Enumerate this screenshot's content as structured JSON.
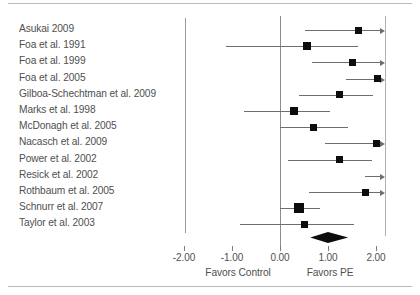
{
  "chart_data": {
    "type": "forest",
    "title": "",
    "xlabel": "",
    "ylabel": "",
    "xlim": [
      -2.0,
      2.2
    ],
    "xticks": [
      -2.0,
      -1.0,
      0.0,
      1.0,
      2.0
    ],
    "xtick_labels": [
      "-2.00",
      "-1.00",
      "0.00",
      "1.00",
      "2.00"
    ],
    "grid": false,
    "null_line": 0.0,
    "left_axis_label": "Favors Control",
    "right_axis_label": "Favors PE",
    "effect_measure": "Hedges' g",
    "categories": [
      "Asukai 2009",
      "Foa et al. 1991",
      "Foa et al. 1999",
      "Foa et al. 2005",
      "Gilboa-Schechtman et al. 2009",
      "Marks et al. 1998",
      "McDonagh et al. 2005",
      "Nacasch et al. 2009",
      "Power et al. 2002",
      "Resick et al. 2002",
      "Rothbaum et al. 2005",
      "Schnurr et al. 2007",
      "Taylor et al. 2003"
    ],
    "studies": [
      {
        "label": "Asukai 2009",
        "effect": 1.63,
        "ci_low": 0.52,
        "ci_high": 2.2,
        "marker_size": 7,
        "clipped_high": true,
        "clipped_low": false
      },
      {
        "label": "Foa et al. 1991",
        "effect": 0.56,
        "ci_low": -1.13,
        "ci_high": 1.62,
        "marker_size": 8,
        "clipped_high": false,
        "clipped_low": false
      },
      {
        "label": "Foa et al. 1999",
        "effect": 1.52,
        "ci_low": 0.67,
        "ci_high": 2.2,
        "marker_size": 7,
        "clipped_high": true,
        "clipped_low": false
      },
      {
        "label": "Foa et al. 2005",
        "effect": 2.04,
        "ci_low": 1.38,
        "ci_high": 2.2,
        "marker_size": 7,
        "clipped_high": true,
        "clipped_low": false
      },
      {
        "label": "Gilboa-Schechtman et al. 2009",
        "effect": 1.23,
        "ci_low": 0.4,
        "ci_high": 1.94,
        "marker_size": 7,
        "clipped_high": false,
        "clipped_low": false
      },
      {
        "label": "Marks et al. 1998",
        "effect": 0.29,
        "ci_low": -0.75,
        "ci_high": 1.04,
        "marker_size": 8,
        "clipped_high": false,
        "clipped_low": false
      },
      {
        "label": "McDonagh et al. 2005",
        "effect": 0.69,
        "ci_low": 0.0,
        "ci_high": 1.42,
        "marker_size": 7,
        "clipped_high": false,
        "clipped_low": false
      },
      {
        "label": "Nacasch et al. 2009",
        "effect": 2.02,
        "ci_low": 0.94,
        "ci_high": 2.2,
        "marker_size": 7,
        "clipped_high": true,
        "clipped_low": false
      },
      {
        "label": "Power et al. 2002",
        "effect": 1.23,
        "ci_low": 0.17,
        "ci_high": 1.92,
        "marker_size": 7,
        "clipped_high": false,
        "clipped_low": false
      },
      {
        "label": "Resick et al. 2002",
        "effect": null,
        "ci_low": 1.78,
        "ci_high": 2.2,
        "marker_size": 0,
        "clipped_high": true,
        "clipped_low": false
      },
      {
        "label": "Rothbaum et al. 2005",
        "effect": 1.79,
        "ci_low": 0.6,
        "ci_high": 2.2,
        "marker_size": 7,
        "clipped_high": true,
        "clipped_low": false
      },
      {
        "label": "Schnurr et al. 2007",
        "effect": 0.4,
        "ci_low": 0.0,
        "ci_high": 0.84,
        "marker_size": 10,
        "clipped_high": false,
        "clipped_low": false
      },
      {
        "label": "Taylor et al. 2003",
        "effect": 0.52,
        "ci_low": -0.83,
        "ci_high": 1.55,
        "marker_size": 7,
        "clipped_high": false,
        "clipped_low": false
      }
    ],
    "summary": {
      "label": "Overall",
      "effect": 1.0,
      "ci_low": 0.63,
      "ci_high": 1.42
    },
    "colors": {
      "marker": "#0d0d0d",
      "line": "#6e6e6e",
      "axis": "#8c8c8c",
      "text": "#4f4f4f",
      "background": "#ffffff"
    }
  }
}
